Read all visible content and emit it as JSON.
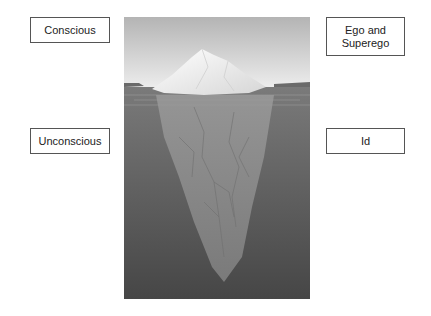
{
  "diagram": {
    "labels": {
      "conscious": "Conscious",
      "unconscious": "Unconscious",
      "ego_superego": "Ego and Superego",
      "id": "Id"
    },
    "colors": {
      "sky_top": "#b8b8b8",
      "sky_bottom": "#e6e6e6",
      "water": "#6e6e6e",
      "water_deep": "#4a4a4a",
      "ice_above": "#f2f2f2",
      "ice_below": "#8a8a8a"
    }
  }
}
